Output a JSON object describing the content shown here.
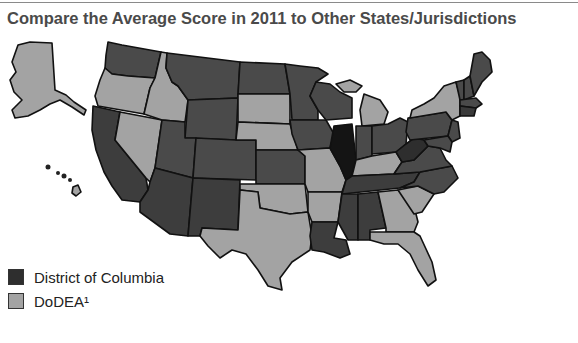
{
  "title": "Compare the Average Score in 2011 to Other States/Jurisdictions",
  "colors": {
    "very_dark": "#141414",
    "dark": "#4a4a4a",
    "darker": "#383838",
    "light": "#a3a3a3",
    "border": "#111111",
    "background": "#ffffff"
  },
  "legend": {
    "items": [
      {
        "label": "District of Columbia",
        "swatch_color": "#2e2e2e"
      },
      {
        "label": "DoDEA¹",
        "swatch_color": "#a3a3a3"
      }
    ]
  },
  "map": {
    "states_dark": [
      "WA",
      "MT",
      "ND",
      "MN",
      "WI",
      "CA",
      "UT",
      "WY",
      "CO",
      "AZ",
      "NM",
      "KS",
      "IA",
      "SD-no",
      "IN",
      "OH",
      "PA",
      "TN",
      "NC",
      "VA",
      "WV",
      "AL",
      "MS",
      "LA",
      "ME",
      "NH",
      "VT",
      "MA",
      "CT",
      "RI",
      "NJ",
      "MD",
      "DE"
    ],
    "states_light": [
      "AK",
      "OR",
      "ID",
      "NV",
      "SD",
      "NE",
      "MO",
      "OK",
      "TX",
      "AR",
      "KY",
      "MI",
      "NY",
      "GA",
      "SC",
      "FL",
      "HI"
    ],
    "states_very_dark": [
      "IL"
    ]
  }
}
